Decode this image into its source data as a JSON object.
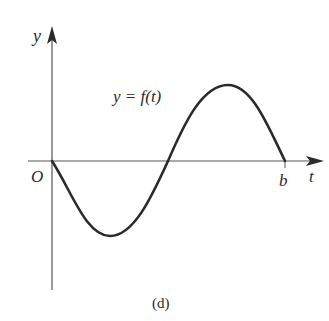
{
  "figure": {
    "caption": "(d)",
    "axes": {
      "y_label": "y",
      "x_label": "t",
      "origin_label": "O",
      "end_label": "b"
    },
    "curve": {
      "label": "y = f(t)",
      "description": "one full sine-like period starting at origin: dips below axis first, crosses axis mid-way, peaks above, returns to axis at b"
    },
    "colors": {
      "axis": "#555555",
      "curve": "#2a2a2a",
      "text": "#2a2a2a",
      "background": "#ffffff"
    }
  }
}
